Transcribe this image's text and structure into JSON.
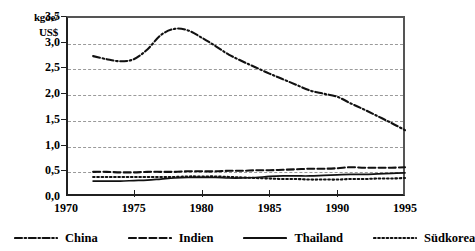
{
  "chart_data": {
    "type": "line",
    "title": "",
    "subtitle": "",
    "xlabel": "",
    "ylabel": "kgoe/ US$",
    "ylabel_line1": "kgoe/",
    "ylabel_line2": "US$",
    "xlim": [
      1970,
      1995
    ],
    "ylim": [
      0.0,
      3.5
    ],
    "yticks": [
      "0,0",
      "0,5",
      "1,0",
      "1,5",
      "2,0",
      "2,5",
      "3,0",
      "3,5"
    ],
    "ytick_values": [
      0.0,
      0.5,
      1.0,
      1.5,
      2.0,
      2.5,
      3.0,
      3.5
    ],
    "xticks": [
      "1970",
      "1975",
      "1980",
      "1985",
      "1990",
      "1995"
    ],
    "xtick_values": [
      1970,
      1975,
      1980,
      1985,
      1990,
      1995
    ],
    "grid": "horizontal-dashed",
    "legend_position": "bottom",
    "x": [
      1972,
      1973,
      1974,
      1975,
      1976,
      1977,
      1978,
      1979,
      1980,
      1981,
      1982,
      1983,
      1984,
      1985,
      1986,
      1987,
      1988,
      1989,
      1990,
      1991,
      1992,
      1993,
      1994,
      1995
    ],
    "series": [
      {
        "name": "China",
        "style": "dash-dot",
        "color": "#111111",
        "values": [
          2.72,
          2.66,
          2.62,
          2.66,
          2.85,
          3.13,
          3.25,
          3.22,
          3.08,
          2.92,
          2.75,
          2.62,
          2.5,
          2.38,
          2.27,
          2.16,
          2.05,
          1.99,
          1.93,
          1.8,
          1.68,
          1.55,
          1.42,
          1.28
        ]
      },
      {
        "name": "Indien",
        "style": "dashed",
        "color": "#111111",
        "values": [
          0.47,
          0.47,
          0.46,
          0.46,
          0.47,
          0.47,
          0.47,
          0.48,
          0.48,
          0.48,
          0.49,
          0.49,
          0.5,
          0.5,
          0.51,
          0.52,
          0.53,
          0.53,
          0.54,
          0.56,
          0.55,
          0.55,
          0.55,
          0.56
        ]
      },
      {
        "name": "Thailand",
        "style": "solid",
        "color": "#111111",
        "values": [
          0.29,
          0.29,
          0.29,
          0.3,
          0.31,
          0.33,
          0.35,
          0.36,
          0.36,
          0.36,
          0.35,
          0.35,
          0.36,
          0.38,
          0.39,
          0.39,
          0.39,
          0.4,
          0.41,
          0.42,
          0.42,
          0.43,
          0.44,
          0.45
        ]
      },
      {
        "name": "Südkorea",
        "style": "dotted",
        "color": "#111111",
        "values": [
          0.37,
          0.37,
          0.37,
          0.37,
          0.37,
          0.37,
          0.37,
          0.38,
          0.38,
          0.38,
          0.37,
          0.36,
          0.35,
          0.34,
          0.33,
          0.33,
          0.32,
          0.32,
          0.32,
          0.33,
          0.33,
          0.34,
          0.34,
          0.35
        ]
      }
    ]
  },
  "legend": {
    "items": [
      {
        "label": "China",
        "style": "dash-dot"
      },
      {
        "label": "Indien",
        "style": "dashed"
      },
      {
        "label": "Thailand",
        "style": "solid"
      },
      {
        "label": "Südkorea",
        "style": "dotted"
      }
    ]
  }
}
